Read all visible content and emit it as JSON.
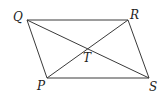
{
  "diagram": {
    "type": "parallelogram-with-diagonals",
    "vertices": {
      "Q": {
        "label": "Q",
        "x": 27,
        "y": 20
      },
      "R": {
        "label": "R",
        "x": 128,
        "y": 20
      },
      "S": {
        "label": "S",
        "x": 149,
        "y": 78
      },
      "P": {
        "label": "P",
        "x": 47,
        "y": 78
      }
    },
    "intersection": {
      "label": "T",
      "x": 87,
      "y": 49
    },
    "edges": [
      [
        "Q",
        "R"
      ],
      [
        "R",
        "S"
      ],
      [
        "S",
        "P"
      ],
      [
        "P",
        "Q"
      ]
    ],
    "diagonals": [
      [
        "Q",
        "S"
      ],
      [
        "P",
        "R"
      ]
    ],
    "colors": {
      "line": "#3a3a3a",
      "text": "#222222",
      "background": "#ffffff"
    }
  }
}
